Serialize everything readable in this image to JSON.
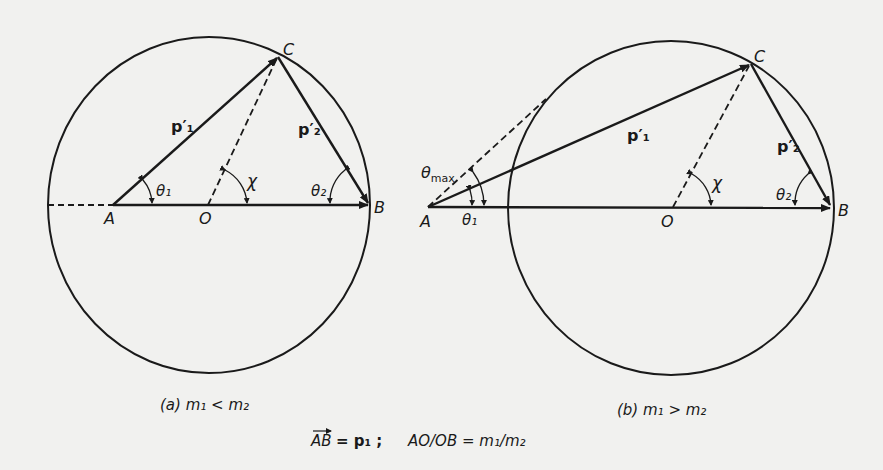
{
  "figure_a": {
    "caption": "(a) m₁ < m₂",
    "points": {
      "A": "A",
      "O": "O",
      "B": "B",
      "C": "C"
    },
    "vectors": {
      "p1_prime": "p′₁",
      "p2_prime": "p′₂"
    },
    "angles": {
      "theta1": "θ₁",
      "theta2": "θ₂",
      "chi": "χ"
    }
  },
  "figure_b": {
    "caption": "(b) m₁ > m₂",
    "points": {
      "A": "A",
      "O": "O",
      "B": "B",
      "C": "C"
    },
    "vectors": {
      "p1_prime": "p′₁",
      "p2_prime": "p′₂"
    },
    "angles": {
      "theta1": "θ₁",
      "theta2": "θ₂",
      "chi": "χ",
      "theta_max": "θ",
      "theta_max_sub": "max"
    }
  },
  "legend": {
    "ab_vector": "AB",
    "ab_equals": "= p₁  ;",
    "ratio": "AO/OB = m₁/m₂"
  }
}
